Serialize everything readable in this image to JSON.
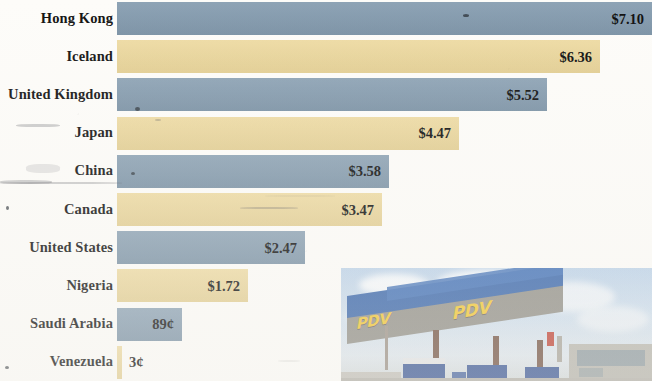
{
  "chart_data": {
    "type": "bar",
    "orientation": "horizontal",
    "title": "",
    "subtitle": "",
    "xlabel": "",
    "ylabel": "",
    "xlim": [
      0,
      7.1
    ],
    "grid": false,
    "legend": "none",
    "value_unit": "USD per gallon",
    "categories": [
      "Hong Kong",
      "Iceland",
      "United Kingdom",
      "Japan",
      "China",
      "Canada",
      "United States",
      "Nigeria",
      "Saudi Arabia",
      "Venezuela"
    ],
    "values": [
      7.1,
      6.36,
      5.52,
      4.47,
      3.58,
      3.47,
      2.47,
      1.72,
      0.89,
      0.03
    ],
    "value_labels": [
      "$7.10",
      "$6.36",
      "$5.52",
      "$4.47",
      "$3.58",
      "$3.47",
      "$2.47",
      "$1.72",
      "89¢",
      "3¢"
    ],
    "bar_colors": [
      "#8199ad",
      "#ecd79a",
      "#8199ad",
      "#ecd79a",
      "#8199ad",
      "#ecd79a",
      "#8199ad",
      "#ecd79a",
      "#8199ad",
      "#ecd79a"
    ],
    "label_placement": [
      "inside",
      "inside",
      "inside",
      "inside",
      "inside",
      "inside",
      "inside",
      "inside",
      "inside",
      "outside"
    ]
  },
  "rows": [
    {
      "label": "Hong Kong",
      "value_label": "$7.10",
      "value": 7.1,
      "color": "blue",
      "bar_px": 535,
      "inside": true
    },
    {
      "label": "Iceland",
      "value_label": "$6.36",
      "value": 6.36,
      "color": "yellow",
      "bar_px": 483,
      "inside": true
    },
    {
      "label": "United Kingdom",
      "value_label": "$5.52",
      "value": 5.52,
      "color": "blue",
      "bar_px": 430,
      "inside": true
    },
    {
      "label": "Japan",
      "value_label": "$4.47",
      "value": 4.47,
      "color": "yellow",
      "bar_px": 342,
      "inside": true
    },
    {
      "label": "China",
      "value_label": "$3.58",
      "value": 3.58,
      "color": "blue",
      "bar_px": 272,
      "inside": true
    },
    {
      "label": "Canada",
      "value_label": "$3.47",
      "value": 3.47,
      "color": "yellow",
      "bar_px": 265,
      "inside": true
    },
    {
      "label": "United States",
      "value_label": "$2.47",
      "value": 2.47,
      "color": "blue",
      "bar_px": 188,
      "inside": true
    },
    {
      "label": "Nigeria",
      "value_label": "$1.72",
      "value": 1.72,
      "color": "yellow",
      "bar_px": 131,
      "inside": true
    },
    {
      "label": "Saudi Arabia",
      "value_label": "89¢",
      "value": 0.89,
      "color": "blue",
      "bar_px": 65,
      "inside": true
    },
    {
      "label": "Venezuela",
      "value_label": "3¢",
      "value": 0.03,
      "color": "yellow",
      "bar_px": 5,
      "inside": false
    }
  ],
  "photo": {
    "caption": "",
    "brand_text": "PDV",
    "scene": "gas-station-canopy"
  },
  "colors": {
    "bar_blue": "#8199ad",
    "bar_yellow": "#ecd79a",
    "background": "#fdfcf9",
    "text": "#131313"
  }
}
